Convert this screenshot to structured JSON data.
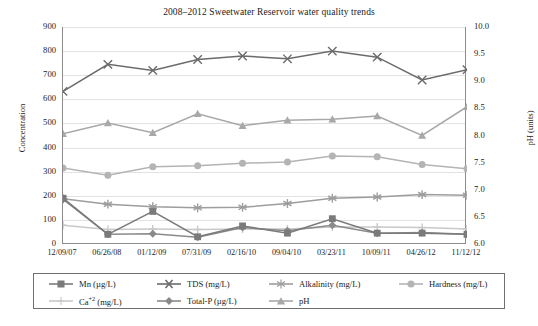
{
  "chart_data": {
    "type": "line",
    "title": "2008–2012 Sweetwater Reservoir water quality trends",
    "xlabel": "",
    "ylabel": "Concentration",
    "y2label": "pH (units)",
    "categories": [
      "12/09/07",
      "06/26/08",
      "01/12/09",
      "07/31/09",
      "02/16/10",
      "09/04/10",
      "03/23/11",
      "10/09/11",
      "04/26/12",
      "11/12/12"
    ],
    "ylim": [
      0,
      900
    ],
    "yticks": [
      "0",
      "100",
      "200",
      "300",
      "400",
      "500",
      "600",
      "700",
      "800",
      "900"
    ],
    "y2lim": [
      6.0,
      10.0
    ],
    "y2ticks": [
      "6.0",
      "6.5",
      "7.0",
      "7.5",
      "8.0",
      "8.5",
      "9.0",
      "9.5",
      "10.0"
    ],
    "grid": true,
    "legend_position": "bottom",
    "series": [
      {
        "name": "Mn (µg/L)",
        "unit": "µg/L",
        "axis": "left",
        "marker": "square",
        "color": "#7a7a7a",
        "values": [
          190,
          40,
          135,
          30,
          75,
          45,
          105,
          45,
          45,
          40
        ]
      },
      {
        "name": "TDS (mg/L)",
        "unit": "mg/L",
        "axis": "left",
        "marker": "x",
        "color": "#6b6b6b",
        "values": [
          633,
          745,
          720,
          765,
          780,
          768,
          800,
          775,
          680,
          723
        ]
      },
      {
        "name": "Alkalinity (mg/L)",
        "unit": "mg/L",
        "axis": "left",
        "marker": "asterisk",
        "color": "#9d9d9d",
        "values": [
          188,
          165,
          155,
          150,
          152,
          168,
          190,
          195,
          205,
          202
        ]
      },
      {
        "name": "Hardness (mg/L)",
        "unit": "mg/L",
        "axis": "left",
        "marker": "circle",
        "color": "#b4b4b4",
        "values": [
          315,
          285,
          320,
          325,
          335,
          340,
          365,
          362,
          330,
          312
        ]
      },
      {
        "name": "Ca⁺² (mg/L)",
        "unit": "mg/L",
        "axis": "left",
        "marker": "plus",
        "color": "#c9c9c9",
        "values": [
          78,
          60,
          62,
          60,
          62,
          62,
          70,
          70,
          68,
          62
        ]
      },
      {
        "name": "Total-P (µg/L)",
        "unit": "µg/L",
        "axis": "left",
        "marker": "diamond",
        "color": "#8a8a8a",
        "values": [
          185,
          40,
          42,
          28,
          68,
          55,
          78,
          45,
          48,
          40
        ]
      },
      {
        "name": "pH",
        "unit": "units",
        "axis": "right",
        "marker": "triangle",
        "color": "#a8a8a8",
        "values": [
          8.03,
          8.23,
          8.05,
          8.4,
          8.18,
          8.28,
          8.3,
          8.36,
          8.0,
          8.53
        ]
      }
    ]
  },
  "legend": {
    "items": [
      {
        "label": "Mn (µg/L)"
      },
      {
        "label": "TDS (mg/L)"
      },
      {
        "label": "Alkalinity (mg/L)"
      },
      {
        "label": "Hardness (mg/L)"
      },
      {
        "label": "Ca"
      },
      {
        "label": "Total-P (µg/L)"
      },
      {
        "label": "pH"
      }
    ],
    "ca_sup": "+2",
    "ca_tail": " (mg/L)"
  }
}
